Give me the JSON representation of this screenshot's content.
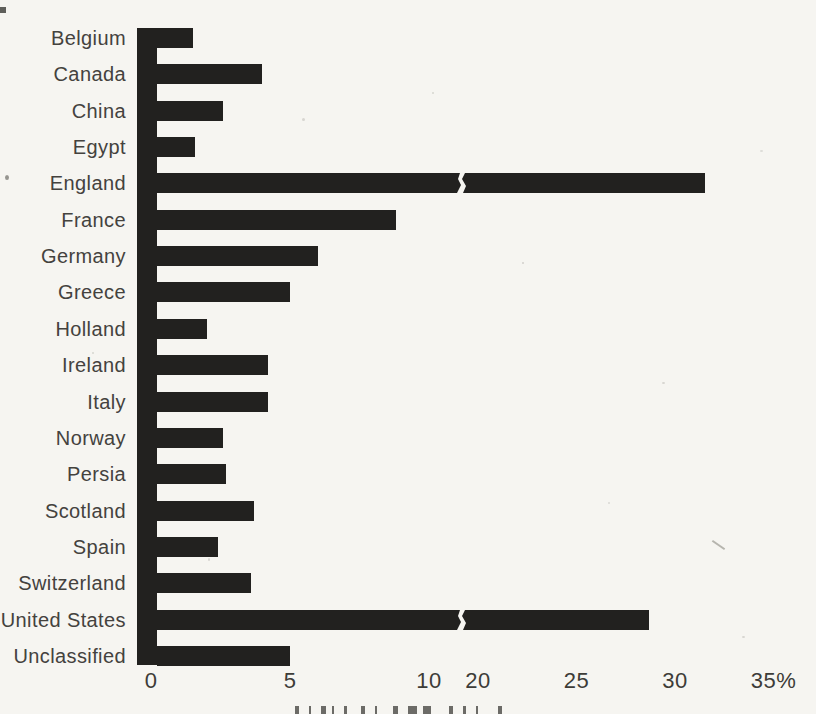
{
  "page": {
    "background_color": "#f6f5f1",
    "bar_color": "#22211f",
    "text_color": "#44423e"
  },
  "chart_data": {
    "type": "bar",
    "orientation": "horizontal",
    "title": "",
    "xlabel": "",
    "ylabel": "",
    "unit": "%",
    "categories": [
      "Belgium",
      "Canada",
      "China",
      "Egypt",
      "England",
      "France",
      "Germany",
      "Greece",
      "Holland",
      "Ireland",
      "Italy",
      "Norway",
      "Persia",
      "Scotland",
      "Spain",
      "Switzerland",
      "United States",
      "Unclassified"
    ],
    "values": [
      1.5,
      4.0,
      2.6,
      1.6,
      31.5,
      8.8,
      6.0,
      5.0,
      2.0,
      4.2,
      4.2,
      2.6,
      2.7,
      3.7,
      2.4,
      3.6,
      28.7,
      5.0
    ],
    "x_axis": {
      "tick_labels": [
        "0",
        "5",
        "10",
        "20",
        "25",
        "30",
        "35%"
      ],
      "tick_values": [
        0,
        5,
        10,
        20,
        25,
        30,
        35
      ],
      "xlim": [
        0,
        35
      ],
      "axis_break": {
        "between": [
          10,
          20
        ],
        "bars_with_break_mark": [
          "England",
          "United States"
        ]
      },
      "grid": false
    },
    "legend": null
  }
}
